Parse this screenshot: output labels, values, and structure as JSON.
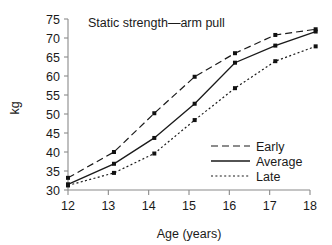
{
  "chart_data": {
    "type": "line",
    "title": "Static strength—arm pull",
    "xlabel": "Age (years)",
    "ylabel": "kg",
    "x": [
      12,
      13,
      14,
      15,
      16,
      17,
      18
    ],
    "xticklabels": [
      "12",
      "13",
      "14",
      "15",
      "16",
      "17",
      "18"
    ],
    "yticks": [
      30,
      35,
      40,
      45,
      50,
      55,
      60,
      65,
      70,
      75
    ],
    "yticklabels": [
      "30",
      "35",
      "40",
      "45",
      "50",
      "55",
      "60",
      "65",
      "70",
      "75"
    ],
    "xlim": [
      12,
      18
    ],
    "ylim": [
      30,
      75
    ],
    "grid": false,
    "legend_position": "lower right",
    "marker": "square",
    "series": [
      {
        "name": "Early",
        "linestyle": "dashed",
        "color": "#1a1a1a",
        "values": [
          33.2,
          40.0,
          50.2,
          59.8,
          66.0,
          70.8,
          72.3
        ]
      },
      {
        "name": "Average",
        "linestyle": "solid",
        "color": "#1a1a1a",
        "values": [
          31.5,
          36.9,
          43.7,
          52.7,
          63.5,
          68.0,
          71.7
        ]
      },
      {
        "name": "Late",
        "linestyle": "dotted",
        "color": "#1a1a1a",
        "values": [
          31.2,
          34.5,
          39.6,
          48.4,
          56.8,
          63.9,
          67.8
        ]
      }
    ]
  },
  "legend": {
    "items": [
      {
        "label": "Early"
      },
      {
        "label": "Average"
      },
      {
        "label": "Late"
      }
    ]
  }
}
